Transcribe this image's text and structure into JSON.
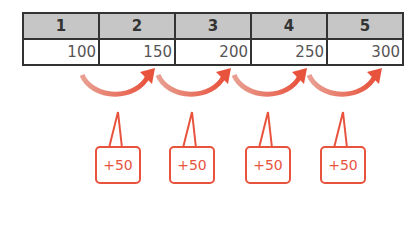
{
  "table": {
    "headers": [
      "1",
      "2",
      "3",
      "4",
      "5"
    ],
    "values": [
      "100",
      "150",
      "200",
      "250",
      "300"
    ]
  },
  "increments": [
    {
      "from": 1,
      "to": 2,
      "label": "+50"
    },
    {
      "from": 2,
      "to": 3,
      "label": "+50"
    },
    {
      "from": 3,
      "to": 4,
      "label": "+50"
    },
    {
      "from": 4,
      "to": 5,
      "label": "+50"
    }
  ],
  "colors": {
    "accent": "#e8533d",
    "header_bg": "#c6c6c6",
    "border": "#333333"
  }
}
